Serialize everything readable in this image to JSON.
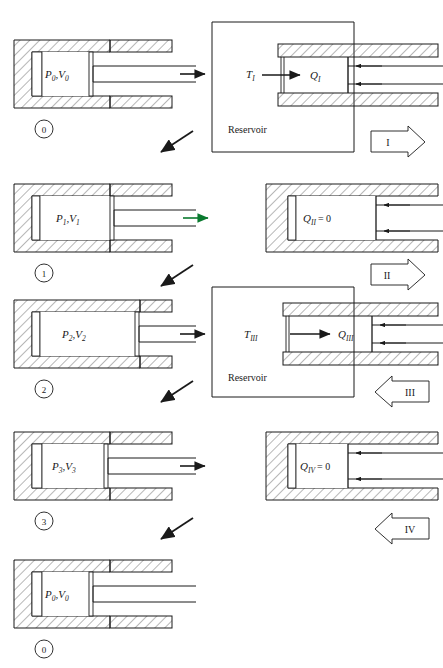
{
  "figure": {
    "line_color": "#1a1a1a",
    "hatch_color": "#555555",
    "accent_green": "#0a7a2f"
  },
  "rows": [
    {
      "id": "row-0",
      "state_label": "0",
      "left_cylinder_label_main": "P",
      "left_cylinder_label_sub1": "0",
      "left_cylinder_label_sep": ",",
      "left_cylinder_label_main2": "V",
      "left_cylinder_label_sub2": "0",
      "left_cylinder_text": "P0,V0",
      "transition_arrow": "right-arrow",
      "reservoir": {
        "present": true,
        "temperature_main": "T",
        "temperature_sub": "I",
        "temperature_text": "TI",
        "caption": "Reservoir"
      },
      "heat_main": "Q",
      "heat_sub": "I",
      "heat_text": "QI",
      "process_label": "I",
      "process_arrow_direction": "right"
    },
    {
      "id": "row-1",
      "state_label": "1",
      "left_cylinder_text": "P1,V1",
      "left_cylinder_label_main": "P",
      "left_cylinder_label_sub1": "1",
      "left_cylinder_label_main2": "V",
      "left_cylinder_label_sub2": "1",
      "transition_arrow": "right-arrow-green",
      "reservoir": {
        "present": false
      },
      "heat_main": "Q",
      "heat_sub": "II",
      "heat_text": "QII = 0",
      "heat_value": "= 0",
      "process_label": "II",
      "process_arrow_direction": "right"
    },
    {
      "id": "row-2",
      "state_label": "2",
      "left_cylinder_text": "P2,V2",
      "left_cylinder_label_main": "P",
      "left_cylinder_label_sub1": "2",
      "left_cylinder_label_main2": "V",
      "left_cylinder_label_sub2": "2",
      "transition_arrow": "right-arrow",
      "reservoir": {
        "present": true,
        "temperature_main": "T",
        "temperature_sub": "III",
        "temperature_text": "TIII",
        "caption": "Reservoir"
      },
      "heat_main": "Q",
      "heat_sub": "III",
      "heat_text": "QIII",
      "process_label": "III",
      "process_arrow_direction": "left"
    },
    {
      "id": "row-3",
      "state_label": "3",
      "left_cylinder_text": "P3,V3",
      "left_cylinder_label_main": "P",
      "left_cylinder_label_sub1": "3",
      "left_cylinder_label_main2": "V",
      "left_cylinder_label_sub2": "3",
      "transition_arrow": "right-arrow",
      "reservoir": {
        "present": false
      },
      "heat_main": "Q",
      "heat_sub": "IV",
      "heat_text": "QIV = 0",
      "heat_value": "= 0",
      "process_label": "IV",
      "process_arrow_direction": "left"
    },
    {
      "id": "row-4",
      "state_label": "0",
      "left_cylinder_text": "P0,V0",
      "left_cylinder_label_main": "P",
      "left_cylinder_label_sub1": "0",
      "left_cylinder_label_main2": "V",
      "left_cylinder_label_sub2": "0",
      "transition_arrow": "none",
      "reservoir": {
        "present": false
      }
    }
  ],
  "symbols": {
    "comma": ",",
    "equals_zero": "= 0",
    "reservoir_caption": "Reservoir"
  }
}
